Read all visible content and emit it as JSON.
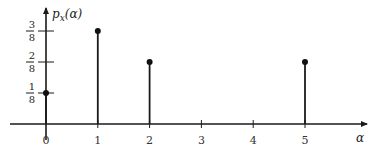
{
  "chart_data": {
    "type": "stem",
    "title": "",
    "xlabel": "α",
    "ylabel": "p_x(α)",
    "ylabel_main": "p",
    "ylabel_sub": "x",
    "ylabel_arg": "(α)",
    "x": [
      0,
      1,
      2,
      5
    ],
    "values": [
      0.125,
      0.375,
      0.25,
      0.25
    ],
    "xlim": [
      0,
      6
    ],
    "ylim": [
      0,
      0.45
    ],
    "xticks": [
      0,
      1,
      2,
      3,
      4,
      5
    ],
    "xtick_labels": [
      "0",
      "1",
      "2",
      "3",
      "4",
      "5"
    ],
    "yticks": [
      {
        "value": 0.125,
        "num": "1",
        "den": "8"
      },
      {
        "value": 0.25,
        "num": "2",
        "den": "8"
      },
      {
        "value": 0.375,
        "num": "3",
        "den": "8"
      }
    ],
    "grid": false,
    "legend": "none"
  }
}
